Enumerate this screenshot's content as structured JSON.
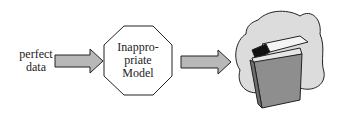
{
  "diagram": {
    "input_label_line1": "perfect",
    "input_label_line2": "data",
    "model_label_line1": "Inappro-",
    "model_label_line2": "priate",
    "model_label_line3": "Model",
    "output_icon": "trash-can-icon",
    "colors": {
      "arrow_fill": "#b8b8b8",
      "cloud_fill": "#dcdcdc",
      "can_fill": "#8e8e8e",
      "stroke": "#222222"
    }
  }
}
